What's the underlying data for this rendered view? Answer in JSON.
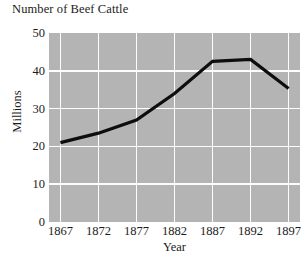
{
  "chart_data": {
    "type": "line",
    "title": "Number of Beef Cattle",
    "xlabel": "Year",
    "ylabel": "Millions",
    "categories": [
      1867,
      1872,
      1877,
      1882,
      1887,
      1892,
      1897
    ],
    "x_tick_labels": [
      "1867",
      "1872",
      "1877",
      "1882",
      "1887",
      "1892",
      "1897"
    ],
    "values": [
      21,
      23.5,
      27,
      34,
      42.5,
      43,
      35.3
    ],
    "series": [
      {
        "name": "Beef cattle",
        "values": [
          21,
          23.5,
          27,
          34,
          42.5,
          43,
          35.3
        ]
      }
    ],
    "ylim": [
      0,
      50
    ],
    "y_ticks": [
      0,
      10,
      20,
      30,
      40,
      50
    ],
    "y_tick_labels": [
      "0",
      "10",
      "20",
      "30",
      "40",
      "50"
    ],
    "xlim": [
      1865.5,
      1898.5
    ],
    "grid": true,
    "legend": "none",
    "plot_background_color": "#b4b4b4",
    "gridline_color": "#fdfdfd",
    "line_color": "#0d0d0d",
    "page_background_color": "#ffffff"
  }
}
